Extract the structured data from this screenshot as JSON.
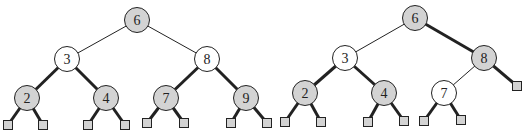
{
  "trees": [
    {
      "name": "left-tree",
      "nodes": [
        {
          "id": "L6",
          "label": "6",
          "x": 137,
          "y": 20,
          "fill": "gray"
        },
        {
          "id": "L3",
          "label": "3",
          "x": 67,
          "y": 59,
          "fill": "white"
        },
        {
          "id": "L8",
          "label": "8",
          "x": 207,
          "y": 59,
          "fill": "white"
        },
        {
          "id": "L2",
          "label": "2",
          "x": 27,
          "y": 98,
          "fill": "gray"
        },
        {
          "id": "L4",
          "label": "4",
          "x": 106,
          "y": 98,
          "fill": "gray"
        },
        {
          "id": "L7",
          "label": "7",
          "x": 166,
          "y": 98,
          "fill": "gray"
        },
        {
          "id": "L9",
          "label": "9",
          "x": 246,
          "y": 98,
          "fill": "gray"
        }
      ],
      "leaves": [
        {
          "id": "La",
          "x": 8,
          "y": 125
        },
        {
          "id": "Lb",
          "x": 43,
          "y": 125
        },
        {
          "id": "Lc",
          "x": 88,
          "y": 125
        },
        {
          "id": "Ld",
          "x": 125,
          "y": 125
        },
        {
          "id": "Le",
          "x": 147,
          "y": 123
        },
        {
          "id": "Lf",
          "x": 184,
          "y": 123
        },
        {
          "id": "Lg",
          "x": 231,
          "y": 123
        },
        {
          "id": "Lh",
          "x": 267,
          "y": 123
        }
      ],
      "edges": [
        {
          "from": "L6",
          "to": "L3",
          "bold": false
        },
        {
          "from": "L6",
          "to": "L8",
          "bold": false
        },
        {
          "from": "L3",
          "to": "L2",
          "bold": true
        },
        {
          "from": "L3",
          "to": "L4",
          "bold": true
        },
        {
          "from": "L8",
          "to": "L7",
          "bold": true
        },
        {
          "from": "L8",
          "to": "L9",
          "bold": true
        },
        {
          "from": "L2",
          "to": "La",
          "bold": true
        },
        {
          "from": "L2",
          "to": "Lb",
          "bold": true
        },
        {
          "from": "L4",
          "to": "Lc",
          "bold": true
        },
        {
          "from": "L4",
          "to": "Ld",
          "bold": true
        },
        {
          "from": "L7",
          "to": "Le",
          "bold": true
        },
        {
          "from": "L7",
          "to": "Lf",
          "bold": true
        },
        {
          "from": "L9",
          "to": "Lg",
          "bold": true
        },
        {
          "from": "L9",
          "to": "Lh",
          "bold": true
        }
      ]
    },
    {
      "name": "right-tree",
      "nodes": [
        {
          "id": "R6",
          "label": "6",
          "x": 415,
          "y": 18,
          "fill": "gray"
        },
        {
          "id": "R3",
          "label": "3",
          "x": 345,
          "y": 58,
          "fill": "white"
        },
        {
          "id": "R8",
          "label": "8",
          "x": 484,
          "y": 58,
          "fill": "gray"
        },
        {
          "id": "R2",
          "label": "2",
          "x": 305,
          "y": 93,
          "fill": "gray"
        },
        {
          "id": "R4",
          "label": "4",
          "x": 384,
          "y": 93,
          "fill": "gray"
        },
        {
          "id": "R7",
          "label": "7",
          "x": 444,
          "y": 93,
          "fill": "white"
        }
      ],
      "leaves": [
        {
          "id": "Ra",
          "x": 285,
          "y": 122
        },
        {
          "id": "Rb",
          "x": 321,
          "y": 122
        },
        {
          "id": "Rc",
          "x": 368,
          "y": 122
        },
        {
          "id": "Rd",
          "x": 404,
          "y": 121
        },
        {
          "id": "Re",
          "x": 424,
          "y": 121
        },
        {
          "id": "Rf",
          "x": 461,
          "y": 120
        },
        {
          "id": "Rg",
          "x": 517,
          "y": 86
        }
      ],
      "edges": [
        {
          "from": "R6",
          "to": "R3",
          "bold": false
        },
        {
          "from": "R6",
          "to": "R8",
          "bold": true
        },
        {
          "from": "R3",
          "to": "R2",
          "bold": true
        },
        {
          "from": "R3",
          "to": "R4",
          "bold": true
        },
        {
          "from": "R8",
          "to": "R7",
          "bold": false
        },
        {
          "from": "R8",
          "to": "Rg",
          "bold": true
        },
        {
          "from": "R2",
          "to": "Ra",
          "bold": true
        },
        {
          "from": "R2",
          "to": "Rb",
          "bold": true
        },
        {
          "from": "R4",
          "to": "Rc",
          "bold": true
        },
        {
          "from": "R4",
          "to": "Rd",
          "bold": true
        },
        {
          "from": "R7",
          "to": "Re",
          "bold": true
        },
        {
          "from": "R7",
          "to": "Rf",
          "bold": true
        }
      ]
    }
  ],
  "style": {
    "node_radius": 12.5,
    "leaf_size": 9,
    "gray_fill": "#d3d3d3",
    "white_fill": "#ffffff",
    "stroke": "#222222",
    "thin_width": 1,
    "bold_width": 3
  }
}
